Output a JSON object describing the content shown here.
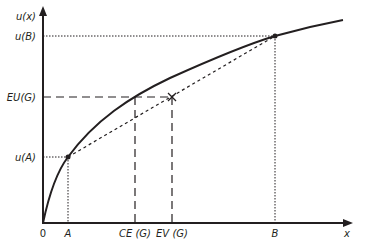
{
  "diagram": {
    "y_axis_label": "u(x)",
    "x_axis_label": "x",
    "origin_label": "0",
    "y_ticks": [
      {
        "label": "u(B)",
        "y": 36
      },
      {
        "label": "EU(G)",
        "y": 97
      },
      {
        "label": "u(A)",
        "y": 157
      }
    ],
    "x_ticks": [
      {
        "label": "A",
        "x": 68
      },
      {
        "label": "CE (G)",
        "x": 135
      },
      {
        "label": "EV (G)",
        "x": 172
      },
      {
        "label": "B",
        "x": 275
      }
    ],
    "points": {
      "A": {
        "x": 68,
        "y": 157
      },
      "B": {
        "x": 275,
        "y": 36
      },
      "G": {
        "x": 172,
        "y": 97,
        "marker": "x"
      }
    },
    "colors": {
      "line": "#231f20",
      "background": "#ffffff"
    }
  }
}
